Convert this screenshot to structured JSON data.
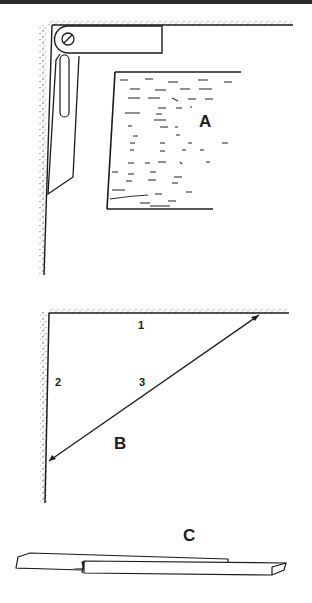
{
  "figure": {
    "panels": [
      {
        "id": "A",
        "label": "A",
        "description": "sliding bevel set against corner and board"
      },
      {
        "id": "B",
        "label": "B",
        "description": "right triangle in corner",
        "sides": [
          "1",
          "2",
          "3"
        ]
      },
      {
        "id": "C",
        "label": "C",
        "description": "two overlapping sliding sticks"
      }
    ]
  },
  "labels": {
    "a": "A",
    "b": "B",
    "c": "C",
    "side1": "1",
    "side2": "2",
    "side3": "3"
  },
  "colors": {
    "ink": "#1c1c1c",
    "paper": "#ffffff",
    "stipple": "#555555"
  }
}
